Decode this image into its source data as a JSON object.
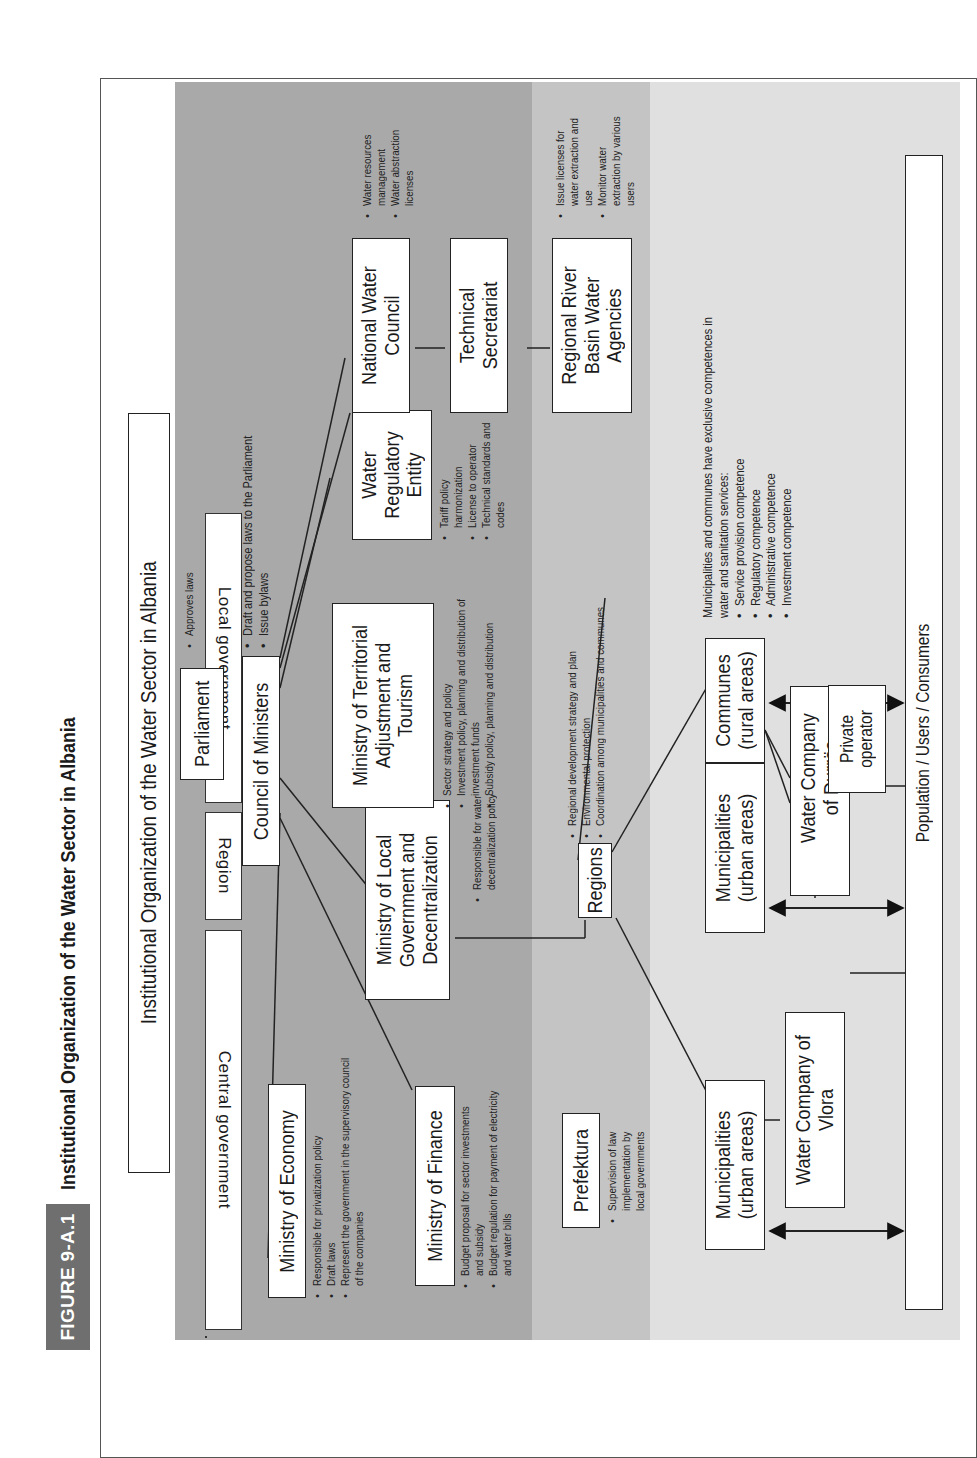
{
  "figure": {
    "tag": "FIGURE 9-A.1",
    "title": "Institutional Organization of the Water Sector in Albania"
  },
  "diagram": {
    "heading": "Institutional Organization of the Water Sector in Albania",
    "bands": {
      "central": "Central government",
      "region": "Region",
      "local": "Local government"
    },
    "nodes": {
      "parliament": "Parliament",
      "council": "Council of Ministers",
      "economy": "Ministry of Economy",
      "finance": "Ministry of Finance",
      "local_gov": "Ministry of Local Government and Decentralization",
      "territorial": "Ministry of Territorial Adjustment and Tourism",
      "regulatory": "Water Regulatory Entity",
      "nwc": "National Water Council",
      "tech_sec": "Technical Secretariat",
      "river_basin": "Regional River Basin Water Agencies",
      "prefektura": "Prefektura",
      "regions": "Regions",
      "muni_1": "Municipalities (urban areas)",
      "muni_2": "Municipalities (urban areas)",
      "communes": "Communes (rural areas)",
      "vlora": "Water Company of Vlora",
      "durres": "Water Company of Durrës",
      "private": "Private operator",
      "population": "Population / Users / Consumers"
    },
    "notes": {
      "parliament": [
        "Approves laws"
      ],
      "council": [
        "Draft and propose laws to the Parliament",
        "Issue bylaws"
      ],
      "economy": [
        "Responsible for privatization policy",
        "Draft laws",
        "Represent the government in the supervisory council of the companies"
      ],
      "finance": [
        "Budget proposal for sector investments and subsidy",
        "Budget regulation for payment of electricity and water bills"
      ],
      "local_gov": [
        "Responsible for water decentralization policy"
      ],
      "territorial": [
        "Sector strategy and policy",
        "Investment policy, planning and distribution of investment funds",
        "Subsidy policy, planning and distribution"
      ],
      "regulatory": [
        "Tariff policy harmonization",
        "License to operator",
        "Technical standards and codes"
      ],
      "nwc": [
        "Water resources management",
        "Water abstraction licenses"
      ],
      "river_basin": [
        "Issue licenses for water extraction and use",
        "Monitor water extraction by various users"
      ],
      "prefektura": [
        "Supervision of law implementation by local governments"
      ],
      "regions": [
        "Regional development strategy and plan",
        "Environmental protection",
        "Coordination among municipalities and communes"
      ],
      "local_intro": "Municipalities and communes have exclusive competences in water and sanitation services:",
      "local": [
        "Service provision competence",
        "Regulatory competence",
        "Administrative competence",
        "Investment competence"
      ]
    },
    "colors": {
      "central_band": "#a9a9a9",
      "region_band": "#c4c4c4",
      "local_band": "#e0e0e0",
      "fig_tag": "#6f6f6f"
    }
  }
}
